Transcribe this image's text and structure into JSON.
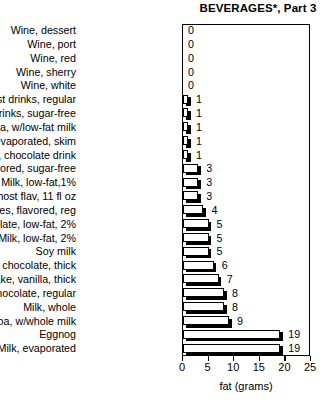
{
  "chart_data": {
    "type": "bar",
    "orientation": "horizontal",
    "title": "BEVERAGES*, Part 3",
    "xlabel": "fat (grams)",
    "ylabel": "",
    "xlim": [
      0,
      25
    ],
    "xticks": [
      0,
      5,
      10,
      15,
      20,
      25
    ],
    "grid": false,
    "legend": null,
    "categories": [
      "Wine, dessert",
      "Wine, port",
      "Wine, red",
      "Wine, sherry",
      "Wine, white",
      "Breakfast drinks, regular",
      "Breakfast drinks, sugar-free",
      "Cocoa, w/low-fat milk",
      "Milk, evaporated, skim",
      "Yoo-Hoo, chocolate drink",
      "Coffees, flavored, sugar-free",
      "Milk, low-fat,1%",
      "Slim Fast, most flav, 11 fl oz",
      "Coffees, flavored, reg",
      "Milk, chocolate, low-fat, 2%",
      "Milk, low-fat, 2%",
      "Soy milk",
      "Shake, chocolate, thick",
      "Shake, vanilla, thick",
      "Milk, chocolate, regular",
      "Milk, whole",
      "Cocoa, w/whole milk",
      "Eggnog",
      "Milk, evaporated"
    ],
    "values": [
      0,
      0,
      0,
      0,
      0,
      1,
      1,
      1,
      1,
      1,
      3,
      3,
      3,
      4,
      5,
      5,
      5,
      6,
      7,
      8,
      8,
      9,
      19,
      19
    ],
    "value_labels": [
      "0",
      "0",
      "0",
      "0",
      "0",
      "1",
      "1",
      "1",
      "1",
      "1",
      "3",
      "3",
      "3",
      "4",
      "5",
      "5",
      "5",
      "6",
      "7",
      "8",
      "8",
      "9",
      "19",
      "19"
    ],
    "tick_labels": [
      "0",
      "5",
      "10",
      "15",
      "20",
      "25"
    ],
    "colors": {
      "bar_fill": "#ffffff",
      "bar_outline": "#000000",
      "bar_shadow": "#000000",
      "background": "#ffffff",
      "text": "#000000"
    }
  }
}
